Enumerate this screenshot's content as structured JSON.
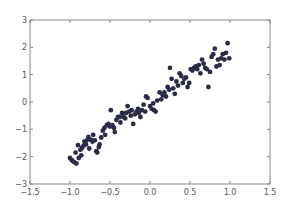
{
  "chart_data": {
    "type": "scatter",
    "title": "",
    "xlabel": "",
    "ylabel": "",
    "xlim": [
      -1.5,
      1.5
    ],
    "ylim": [
      -3,
      3
    ],
    "xticks": [
      -1.5,
      -1.0,
      -0.5,
      0.0,
      0.5,
      1.0,
      1.5
    ],
    "xtick_labels": [
      "−1.5",
      "−1.0",
      "−0.5",
      "0.0",
      "0.5",
      "1.0",
      "1.5"
    ],
    "yticks": [
      -3,
      -2,
      -1,
      0,
      1,
      2,
      3
    ],
    "ytick_labels": [
      "−3",
      "−2",
      "−1",
      "0",
      "1",
      "2",
      "3"
    ],
    "grid": false,
    "legend": null,
    "marker_color": "#2b2b45",
    "axis_color": "#888888",
    "series": [
      {
        "name": "data",
        "points": [
          [
            -1.0,
            -2.05
          ],
          [
            -0.98,
            -2.12
          ],
          [
            -0.97,
            -2.15
          ],
          [
            -0.95,
            -2.2
          ],
          [
            -0.93,
            -1.85
          ],
          [
            -0.92,
            -2.25
          ],
          [
            -0.9,
            -1.58
          ],
          [
            -0.89,
            -2.05
          ],
          [
            -0.87,
            -1.75
          ],
          [
            -0.86,
            -1.95
          ],
          [
            -0.85,
            -1.68
          ],
          [
            -0.83,
            -1.6
          ],
          [
            -0.82,
            -1.45
          ],
          [
            -0.8,
            -1.55
          ],
          [
            -0.79,
            -1.4
          ],
          [
            -0.77,
            -1.28
          ],
          [
            -0.76,
            -1.7
          ],
          [
            -0.74,
            -1.38
          ],
          [
            -0.72,
            -1.45
          ],
          [
            -0.71,
            -1.2
          ],
          [
            -0.69,
            -1.4
          ],
          [
            -0.67,
            -1.8
          ],
          [
            -0.66,
            -1.85
          ],
          [
            -0.64,
            -1.65
          ],
          [
            -0.63,
            -1.55
          ],
          [
            -0.61,
            -1.3
          ],
          [
            -0.59,
            -1.05
          ],
          [
            -0.57,
            -0.95
          ],
          [
            -0.56,
            -1.2
          ],
          [
            -0.54,
            -0.85
          ],
          [
            -0.52,
            -0.8
          ],
          [
            -0.5,
            -0.9
          ],
          [
            -0.49,
            -0.3
          ],
          [
            -0.47,
            -0.85
          ],
          [
            -0.45,
            -0.95
          ],
          [
            -0.44,
            -1.1
          ],
          [
            -0.42,
            -0.65
          ],
          [
            -0.4,
            -0.55
          ],
          [
            -0.38,
            -0.55
          ],
          [
            -0.37,
            -0.75
          ],
          [
            -0.35,
            -0.4
          ],
          [
            -0.33,
            -0.55
          ],
          [
            -0.31,
            -0.6
          ],
          [
            -0.3,
            -0.4
          ],
          [
            -0.28,
            -0.15
          ],
          [
            -0.26,
            -0.35
          ],
          [
            -0.24,
            -0.5
          ],
          [
            -0.23,
            -0.3
          ],
          [
            -0.21,
            -0.8
          ],
          [
            -0.19,
            -0.45
          ],
          [
            -0.17,
            -0.35
          ],
          [
            -0.15,
            -0.25
          ],
          [
            -0.14,
            -0.4
          ],
          [
            -0.12,
            -0.55
          ],
          [
            -0.1,
            -0.3
          ],
          [
            -0.08,
            -0.1
          ],
          [
            -0.06,
            -0.35
          ],
          [
            -0.05,
            0.2
          ],
          [
            -0.03,
            0.15
          ],
          [
            0.0,
            -0.15
          ],
          [
            0.02,
            -0.25
          ],
          [
            0.04,
            -0.05
          ],
          [
            0.05,
            -0.3
          ],
          [
            0.07,
            -0.35
          ],
          [
            0.09,
            0.05
          ],
          [
            0.12,
            0.35
          ],
          [
            0.14,
            0.1
          ],
          [
            0.16,
            0.25
          ],
          [
            0.18,
            0.35
          ],
          [
            0.2,
            0.2
          ],
          [
            0.22,
            0.55
          ],
          [
            0.24,
            0.45
          ],
          [
            0.25,
            1.25
          ],
          [
            0.27,
            0.85
          ],
          [
            0.29,
            0.5
          ],
          [
            0.31,
            0.3
          ],
          [
            0.33,
            0.75
          ],
          [
            0.35,
            0.6
          ],
          [
            0.37,
            1.05
          ],
          [
            0.39,
            0.95
          ],
          [
            0.41,
            0.7
          ],
          [
            0.43,
            0.85
          ],
          [
            0.45,
            0.9
          ],
          [
            0.47,
            0.55
          ],
          [
            0.49,
            0.7
          ],
          [
            0.51,
            1.2
          ],
          [
            0.53,
            1.15
          ],
          [
            0.55,
            1.25
          ],
          [
            0.57,
            1.3
          ],
          [
            0.59,
            1.2
          ],
          [
            0.61,
            1.35
          ],
          [
            0.63,
            1.05
          ],
          [
            0.65,
            1.55
          ],
          [
            0.67,
            1.4
          ],
          [
            0.69,
            1.25
          ],
          [
            0.71,
            1.2
          ],
          [
            0.73,
            0.55
          ],
          [
            0.75,
            1.1
          ],
          [
            0.77,
            1.65
          ],
          [
            0.79,
            1.75
          ],
          [
            0.81,
            1.95
          ],
          [
            0.83,
            1.3
          ],
          [
            0.85,
            1.55
          ],
          [
            0.87,
            1.35
          ],
          [
            0.89,
            1.6
          ],
          [
            0.91,
            1.75
          ],
          [
            0.93,
            1.55
          ],
          [
            0.95,
            1.8
          ],
          [
            0.97,
            2.15
          ],
          [
            0.99,
            1.6
          ]
        ]
      }
    ]
  }
}
